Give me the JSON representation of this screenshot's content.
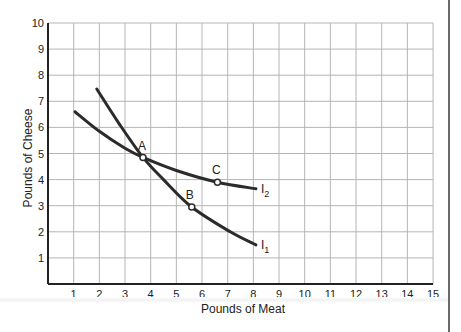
{
  "chart_data": {
    "type": "line",
    "title": "",
    "xlabel": "Pounds of Meat",
    "ylabel": "Pounds of Cheese",
    "xlim": [
      0,
      15
    ],
    "ylim": [
      0,
      10
    ],
    "xticks": [
      1,
      2,
      3,
      4,
      5,
      6,
      7,
      8,
      9,
      10,
      11,
      12,
      13,
      14,
      15
    ],
    "yticks": [
      1,
      2,
      3,
      4,
      5,
      6,
      7,
      8,
      9,
      10
    ],
    "grid": true,
    "legend": "none",
    "series": [
      {
        "name": "I1",
        "label": "I",
        "subscript": "1",
        "x": [
          1.9,
          2.8,
          3.7,
          4.5,
          5.6,
          7.1,
          8.1
        ],
        "y": [
          7.47,
          6.1,
          4.85,
          4.0,
          2.95,
          2.0,
          1.5
        ]
      },
      {
        "name": "I2",
        "label": "I",
        "subscript": "2",
        "x": [
          1.05,
          2.0,
          3.0,
          3.7,
          5.0,
          6.6,
          8.1
        ],
        "y": [
          6.6,
          5.85,
          5.2,
          4.85,
          4.35,
          3.9,
          3.65
        ]
      }
    ],
    "points": [
      {
        "label": "A",
        "x": 3.7,
        "y": 4.85
      },
      {
        "label": "B",
        "x": 5.6,
        "y": 2.95
      },
      {
        "label": "C",
        "x": 6.6,
        "y": 3.9
      }
    ],
    "colors": {
      "curve": "#2b2b2b",
      "grid": "#b5b5b5",
      "axis": "#222222",
      "text": "#222222"
    }
  }
}
